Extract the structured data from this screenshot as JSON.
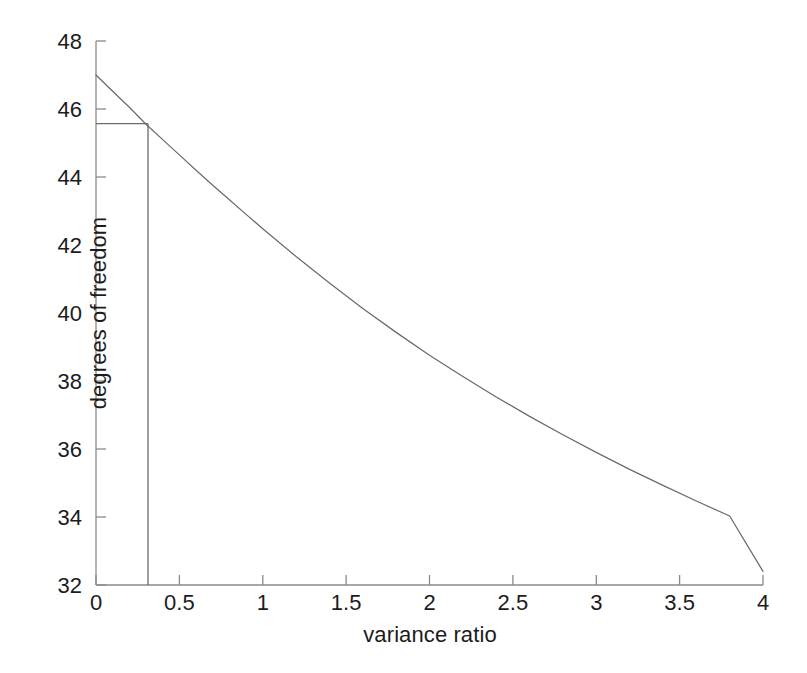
{
  "figure": {
    "background_color": "#ffffff",
    "line_color": "#6b6b6b",
    "axis_color": "#8a8a8a",
    "text_color": "#1c1c1c"
  },
  "chart_data": {
    "type": "line",
    "title": "",
    "xlabel": "variance ratio",
    "ylabel": "degrees of freedom",
    "xlim": [
      0,
      4
    ],
    "ylim": [
      32,
      48
    ],
    "grid": false,
    "legend": null,
    "xticks": [
      0,
      0.5,
      1,
      1.5,
      2,
      2.5,
      3,
      3.5,
      4
    ],
    "xtick_labels": [
      "0",
      "0.5",
      "1",
      "1.5",
      "2",
      "2.5",
      "3",
      "3.5",
      "4"
    ],
    "yticks": [
      32,
      34,
      36,
      38,
      40,
      42,
      44,
      46,
      48
    ],
    "ytick_labels": [
      "32",
      "34",
      "36",
      "38",
      "40",
      "42",
      "44",
      "46",
      "48"
    ],
    "series": [
      {
        "name": "degrees of freedom vs variance ratio",
        "x": [
          0,
          0.1,
          0.2,
          0.3,
          0.4,
          0.5,
          0.6,
          0.7,
          0.8,
          0.9,
          1.0,
          1.2,
          1.4,
          1.6,
          1.8,
          2.0,
          2.2,
          2.4,
          2.6,
          2.8,
          3.0,
          3.2,
          3.4,
          3.6,
          3.8,
          4.0
        ],
        "y": [
          47.0,
          46.52,
          46.05,
          45.55,
          45.1,
          44.65,
          44.2,
          43.76,
          43.33,
          42.9,
          42.48,
          41.66,
          40.88,
          40.13,
          39.43,
          38.76,
          38.13,
          37.53,
          36.96,
          36.42,
          35.9,
          35.4,
          34.93,
          34.47,
          34.03,
          32.4
        ]
      }
    ],
    "annotations": [
      {
        "name": "marker-horizontal",
        "type": "hline",
        "y": 45.55,
        "x_from": 0,
        "x_to": 0.31
      },
      {
        "name": "marker-vertical",
        "type": "vline",
        "x": 0.31,
        "y_from": 32,
        "y_to": 45.55
      }
    ]
  }
}
